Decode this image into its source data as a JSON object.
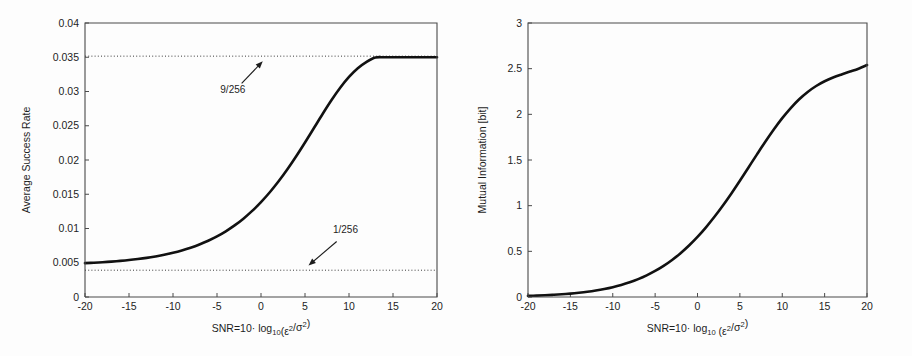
{
  "figure": {
    "background_color": "#fdfdfd",
    "curve_color": "#111111",
    "axis_color": "#4a4a4a",
    "reference_line_color": "#3a3a3a"
  },
  "chart_data": [
    {
      "type": "line",
      "panel": "left",
      "title": "",
      "xlabel": "SNR=10· log10(ε²/σ²)",
      "xlabel_parts": {
        "lead": "SNR=10",
        "dot": "·",
        "log": " log",
        "log_base": "10",
        "open": "(ε",
        "eps_exp": "2",
        "slash": "/σ",
        "sigma_exp": "2",
        "close": ")"
      },
      "ylabel": "Average Success Rate",
      "xlim": [
        -20,
        20
      ],
      "ylim": [
        0,
        0.04
      ],
      "xticks": [
        -20,
        -15,
        -10,
        -5,
        0,
        5,
        10,
        15,
        20
      ],
      "xticklabels": [
        "-20",
        "-15",
        "-10",
        "-5",
        "0",
        "5",
        "10",
        "15",
        "20"
      ],
      "yticks": [
        0,
        0.005,
        0.01,
        0.015,
        0.02,
        0.025,
        0.03,
        0.035,
        0.04
      ],
      "yticklabels": [
        "0",
        "0.005",
        "0.01",
        "0.015",
        "0.02",
        "0.025",
        "0.03",
        "0.035",
        "0.04"
      ],
      "grid": false,
      "legend": "none",
      "series": [
        {
          "name": "Average Success Rate",
          "x": [
            -20,
            -19,
            -18,
            -17,
            -16,
            -15,
            -14,
            -13,
            -12,
            -11,
            -10,
            -9,
            -8,
            -7,
            -6,
            -5,
            -4,
            -3,
            -2,
            -1,
            0,
            1,
            2,
            3,
            4,
            5,
            6,
            7,
            8,
            9,
            10,
            11,
            12,
            13,
            14,
            15,
            16,
            17,
            18,
            19,
            20
          ],
          "values": [
            0.00495,
            0.00501,
            0.00508,
            0.00517,
            0.00527,
            0.00539,
            0.00554,
            0.00571,
            0.00592,
            0.00616,
            0.00645,
            0.00679,
            0.00719,
            0.00766,
            0.00821,
            0.00885,
            0.00959,
            0.01045,
            0.01144,
            0.01257,
            0.01385,
            0.01529,
            0.01689,
            0.01865,
            0.02055,
            0.02256,
            0.02463,
            0.02671,
            0.02871,
            0.03054,
            0.03212,
            0.03339,
            0.03433,
            0.03496,
            0.035,
            0.035,
            0.035,
            0.035,
            0.035,
            0.035,
            0.035
          ]
        }
      ],
      "reference_lines": [
        {
          "name": "upper-asymptote",
          "y": 0.03516,
          "label": "9/256",
          "label_x": -3.2,
          "label_y": 0.0298,
          "arrow_from_x": -2.2,
          "arrow_from_y": 0.0312,
          "arrow_to_x": 0.2,
          "arrow_to_y": 0.0344
        },
        {
          "name": "lower-asymptote",
          "y": 0.00391,
          "label": "1/256",
          "label_x": 9.6,
          "label_y": 0.0094,
          "arrow_from_x": 8.6,
          "arrow_from_y": 0.0081,
          "arrow_to_x": 5.4,
          "arrow_to_y": 0.0046
        }
      ]
    },
    {
      "type": "line",
      "panel": "right",
      "title": "",
      "xlabel": "SNR=10 · log10 (ε²/σ²)",
      "xlabel_parts": {
        "lead": "SNR=10",
        "dot": "·",
        "log": " log",
        "log_base": "10",
        "open": " (ε",
        "eps_exp": "2",
        "slash": "/σ",
        "sigma_exp": "2",
        "close": ")"
      },
      "ylabel": "Mutual Information [bit]",
      "xlim": [
        -20,
        20
      ],
      "ylim": [
        0,
        3
      ],
      "xticks": [
        -20,
        -15,
        -10,
        -5,
        0,
        5,
        10,
        15,
        20
      ],
      "xticklabels": [
        "-20",
        "-15",
        "-10",
        "-5",
        "0",
        "5",
        "10",
        "15",
        "20"
      ],
      "yticks": [
        0,
        0.5,
        1,
        1.5,
        2,
        2.5,
        3
      ],
      "yticklabels": [
        "0",
        "0.5",
        "1",
        "1.5",
        "2",
        "2.5",
        "3"
      ],
      "grid": false,
      "legend": "none",
      "series": [
        {
          "name": "Mutual Information",
          "x": [
            -20,
            -19,
            -18,
            -17,
            -16,
            -15,
            -14,
            -13,
            -12,
            -11,
            -10,
            -9,
            -8,
            -7,
            -6,
            -5,
            -4,
            -3,
            -2,
            -1,
            0,
            1,
            2,
            3,
            4,
            5,
            6,
            7,
            8,
            9,
            10,
            11,
            12,
            13,
            14,
            15,
            16,
            17,
            18,
            19,
            20
          ],
          "values": [
            0.012,
            0.015,
            0.019,
            0.024,
            0.03,
            0.037,
            0.046,
            0.057,
            0.071,
            0.088,
            0.108,
            0.132,
            0.161,
            0.196,
            0.237,
            0.285,
            0.341,
            0.406,
            0.48,
            0.564,
            0.658,
            0.763,
            0.878,
            1.002,
            1.134,
            1.273,
            1.416,
            1.559,
            1.7,
            1.834,
            1.958,
            2.069,
            2.165,
            2.245,
            2.31,
            2.362,
            2.403,
            2.437,
            2.468,
            2.5,
            2.54
          ]
        }
      ],
      "reference_lines": []
    }
  ]
}
